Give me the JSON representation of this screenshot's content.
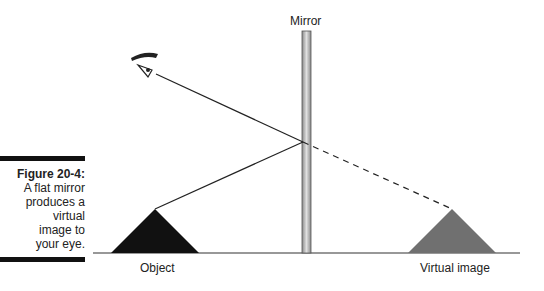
{
  "caption": {
    "title": "Figure 20-4:",
    "lines": [
      "A flat mirror",
      "produces a",
      "virtual",
      "image to",
      "your eye."
    ]
  },
  "labels": {
    "mirror": "Mirror",
    "object": "Object",
    "virtual_image": "Virtual image"
  },
  "colors": {
    "object_fill": "#111111",
    "virtual_fill": "#707070",
    "mirror_fill": "#b8b8b8",
    "line": "#222222"
  },
  "icons": {
    "eye": "eye-icon"
  }
}
